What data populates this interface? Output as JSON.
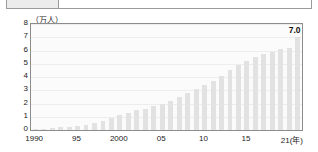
{
  "top_row": {
    "left_cell_label": "",
    "text": "",
    "visible": true
  },
  "chart_data": {
    "type": "bar",
    "title": "",
    "subtitle": "",
    "unit_label": "（万人）",
    "xlabel": "(年)",
    "ylabel": "",
    "ylim": [
      0,
      8
    ],
    "ytick_labels": [
      "8",
      "7",
      "6",
      "5",
      "4",
      "3",
      "2",
      "1",
      "0"
    ],
    "ytick_values": [
      8,
      7,
      6,
      5,
      4,
      3,
      2,
      1,
      0
    ],
    "xtick_labels": [
      "1990",
      "95",
      "2000",
      "05",
      "10",
      "15",
      "21(年)"
    ],
    "xtick_years": [
      1990,
      1995,
      2000,
      2005,
      2010,
      2015,
      2021
    ],
    "grid": true,
    "legend": "none",
    "bar_color": "#e2e2e2",
    "categories": [
      "1990",
      "1991",
      "1992",
      "1993",
      "1994",
      "1995",
      "1996",
      "1997",
      "1998",
      "1999",
      "2000",
      "2001",
      "2002",
      "2003",
      "2004",
      "2005",
      "2006",
      "2007",
      "2008",
      "2009",
      "2010",
      "2011",
      "2012",
      "2013",
      "2014",
      "2015",
      "2016",
      "2017",
      "2018",
      "2019",
      "2020",
      "2021"
    ],
    "values": [
      0.1,
      0.1,
      0.15,
      0.2,
      0.25,
      0.3,
      0.4,
      0.5,
      0.7,
      0.9,
      1.1,
      1.3,
      1.5,
      1.6,
      1.8,
      2.0,
      2.2,
      2.5,
      2.8,
      3.1,
      3.4,
      3.7,
      4.1,
      4.5,
      4.9,
      5.2,
      5.5,
      5.7,
      5.9,
      6.1,
      6.2,
      7.0
    ],
    "annotations": [
      {
        "label": "7.0",
        "category": "2021",
        "value": 7.0
      }
    ]
  }
}
